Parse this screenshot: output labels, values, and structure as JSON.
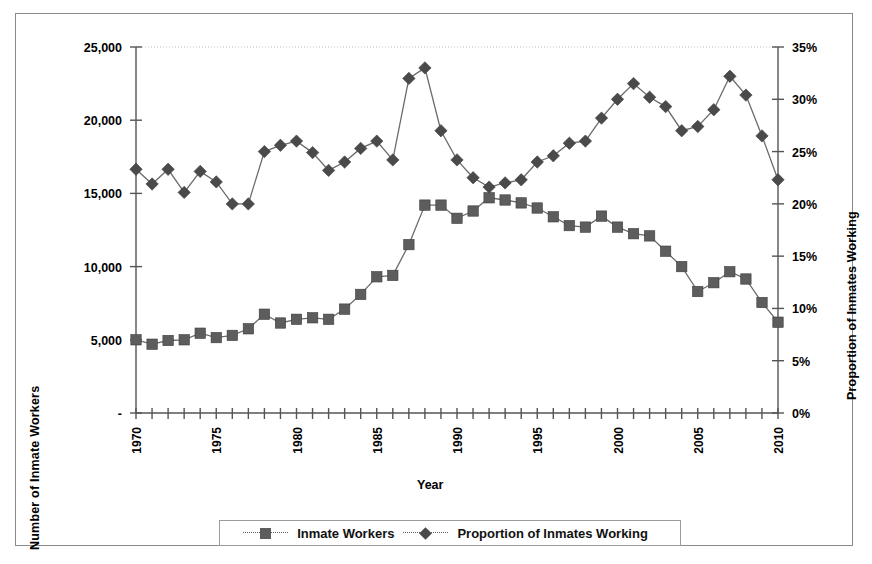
{
  "chart_data": {
    "type": "line",
    "title": "",
    "xlabel": "Year",
    "ylabel_left": "Number of Inmate Workers",
    "ylabel_right": "Proportion of Inmates Working",
    "grid": false,
    "legend_position": "bottom",
    "x": [
      1970,
      1971,
      1972,
      1973,
      1974,
      1975,
      1976,
      1977,
      1978,
      1979,
      1980,
      1981,
      1982,
      1983,
      1984,
      1985,
      1986,
      1987,
      1988,
      1989,
      1990,
      1991,
      1992,
      1993,
      1994,
      1995,
      1996,
      1997,
      1998,
      1999,
      2000,
      2001,
      2002,
      2003,
      2004,
      2005,
      2006,
      2007,
      2008,
      2009,
      2010
    ],
    "xlim": [
      1970,
      2010
    ],
    "xticks": [
      1970,
      1975,
      1980,
      1985,
      1990,
      1995,
      2000,
      2005,
      2010
    ],
    "xtick_labels": [
      "1970",
      "1975",
      "1980",
      "1985",
      "1990",
      "1995",
      "2000",
      "2005",
      "2010"
    ],
    "ylim_left": [
      0,
      25000
    ],
    "yticks_left": [
      0,
      5000,
      10000,
      15000,
      20000,
      25000
    ],
    "ytick_labels_left": [
      "-",
      "5,000",
      "10,000",
      "15,000",
      "20,000",
      "25,000"
    ],
    "ylim_right": [
      0,
      0.35
    ],
    "yticks_right": [
      0,
      5,
      10,
      15,
      20,
      25,
      30,
      35
    ],
    "ytick_labels_right": [
      "0%",
      "5%",
      "10%",
      "15%",
      "20%",
      "25%",
      "30%",
      "35%"
    ],
    "series": [
      {
        "name": "Inmate Workers",
        "axis": "left",
        "marker": "square",
        "color": "#5d5d5d",
        "values": [
          5000,
          4700,
          4950,
          5000,
          5450,
          5150,
          5300,
          5750,
          6750,
          6150,
          6400,
          6500,
          6400,
          7100,
          8100,
          9300,
          9400,
          11500,
          14200,
          14200,
          13300,
          13800,
          14700,
          14550,
          14350,
          14000,
          13400,
          12800,
          12700,
          13450,
          12700,
          12250,
          12100,
          11050,
          10000,
          8300,
          8900,
          9650,
          9150,
          7550,
          6200
        ]
      },
      {
        "name": "Proportion of Inmates Working",
        "axis": "right",
        "marker": "diamond",
        "color": "#4a4a4a",
        "values": [
          23.3,
          21.9,
          23.3,
          21.1,
          23.1,
          22.1,
          20.0,
          20.0,
          25.0,
          25.6,
          26.0,
          24.9,
          23.2,
          24.0,
          25.3,
          26.0,
          24.2,
          32.0,
          33.0,
          27.0,
          24.2,
          22.5,
          21.6,
          22.0,
          22.3,
          24.0,
          24.6,
          25.8,
          26.0,
          28.2,
          30.0,
          31.5,
          30.2,
          29.3,
          27.0,
          27.4,
          29.0,
          32.2,
          30.4,
          26.5,
          22.3
        ]
      }
    ]
  },
  "legend": {
    "entries": [
      {
        "label": "Inmate Workers",
        "marker": "square"
      },
      {
        "label": "Proportion of Inmates Working",
        "marker": "diamond"
      }
    ]
  },
  "axes": {
    "left_title": "Number of Inmate Workers",
    "right_title": "Proportion of Inmates Working",
    "bottom_title": "Year"
  }
}
